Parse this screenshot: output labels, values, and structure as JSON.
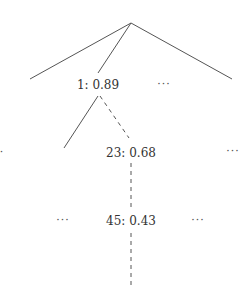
{
  "diagram": {
    "type": "search-tree",
    "colors": {
      "line": "#555555",
      "text": "#333333"
    },
    "nodes": [
      {
        "id": "root",
        "label": ""
      },
      {
        "id": "n1",
        "label": "1: 0.89"
      },
      {
        "id": "n23",
        "label": "23: 0.68"
      },
      {
        "id": "n45",
        "label": "45: 0.43"
      }
    ],
    "ellipses": {
      "level1_right": "···",
      "level2_left": "·",
      "level2_right": "···",
      "level3_left": "···",
      "level3_right": "···"
    },
    "edges": [
      {
        "from": "root",
        "to": "left-branch",
        "style": "solid"
      },
      {
        "from": "root",
        "to": "n1",
        "style": "solid"
      },
      {
        "from": "root",
        "to": "right-branch",
        "style": "solid"
      },
      {
        "from": "n1",
        "to": "left-child",
        "style": "solid"
      },
      {
        "from": "n1",
        "to": "n23",
        "style": "dashed"
      },
      {
        "from": "n23",
        "to": "n45",
        "style": "dashed"
      },
      {
        "from": "n45",
        "to": "below",
        "style": "dashed"
      }
    ]
  }
}
